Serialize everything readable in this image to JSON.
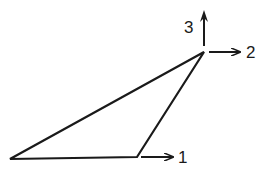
{
  "diagram": {
    "type": "triangle-with-direction-arrows",
    "colors": {
      "stroke": "#1a1a1a",
      "background": "#ffffff"
    },
    "vertices": {
      "bottom_left": [
        10,
        159
      ],
      "bottom_right": [
        137,
        157
      ],
      "top": [
        204,
        52
      ]
    },
    "arrows": [
      {
        "id": "1",
        "label": "1",
        "direction": "right",
        "from": [
          141,
          157
        ],
        "to": [
          173,
          157
        ],
        "label_pos": [
          178,
          163
        ]
      },
      {
        "id": "2",
        "label": "2",
        "direction": "right",
        "from": [
          209,
          52
        ],
        "to": [
          240,
          52
        ],
        "label_pos": [
          246,
          58
        ]
      },
      {
        "id": "3",
        "label": "3",
        "direction": "up",
        "from": [
          204,
          46
        ],
        "to": [
          204,
          12
        ],
        "label_pos": [
          184,
          33
        ]
      }
    ]
  }
}
